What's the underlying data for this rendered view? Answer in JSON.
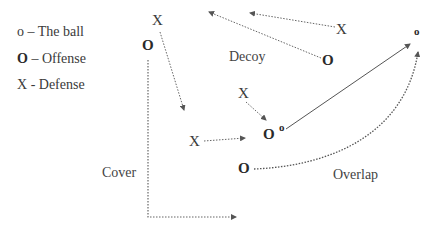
{
  "legend": {
    "ball": {
      "symbol": "o",
      "text": " – The ball"
    },
    "offense": {
      "symbol": "O",
      "text": " – Offense"
    },
    "defense": {
      "symbol": "X",
      "text": " - Defense"
    }
  },
  "labels": {
    "decoy": "Decoy",
    "cover": "Cover",
    "overlap": "Overlap"
  },
  "players": {
    "defender_top_left": "X",
    "offense_left": "O",
    "defender_top_right": "X",
    "offense_decoy": "O",
    "defender_mid": "X",
    "offense_ball_carrier": "O",
    "ball_carrier_ball": "o",
    "defender_low": "X",
    "offense_overlap": "O",
    "ball_target": "o"
  },
  "colors": {
    "text": "#3a3a3a",
    "line": "#555555",
    "background": "#ffffff"
  }
}
